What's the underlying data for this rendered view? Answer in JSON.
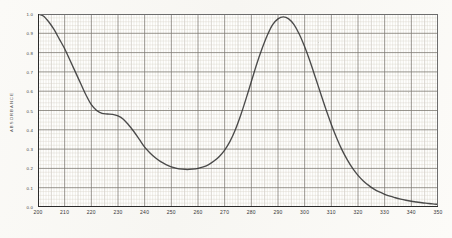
{
  "chart_data": {
    "type": "line",
    "title": "",
    "xlabel": "",
    "ylabel": "ABSORBANCE",
    "xlim": [
      200,
      350
    ],
    "ylim": [
      0.0,
      1.0
    ],
    "grid": true,
    "grid_style": "graph-paper, minor every 1 nm / 0.02 A, major every 10 nm / 0.1 A",
    "legend": "none",
    "xticks": [
      200,
      210,
      220,
      230,
      240,
      250,
      260,
      270,
      280,
      290,
      300,
      310,
      320,
      330,
      340,
      350
    ],
    "xticklabels": [
      "200",
      "210",
      "220",
      "230",
      "240",
      "250",
      "260",
      "270",
      "280",
      "290",
      "300",
      "310",
      "320",
      "330",
      "340",
      "350"
    ],
    "yticks": [
      0.0,
      0.1,
      0.2,
      0.3,
      0.4,
      0.5,
      0.6,
      0.7,
      0.8,
      0.9,
      1.0
    ],
    "yticklabels": [
      "0.0",
      "0.1",
      "0.2",
      "0.3",
      "0.4",
      "0.5",
      "0.6",
      "0.7",
      "0.8",
      "0.9",
      "1.0"
    ],
    "series": [
      {
        "name": "absorbance-trace",
        "color": "#333333",
        "x": [
          200,
          202,
          204,
          206,
          208,
          210,
          212,
          214,
          216,
          218,
          220,
          222,
          224,
          226,
          228,
          230,
          232,
          234,
          236,
          238,
          240,
          242,
          244,
          246,
          248,
          250,
          252,
          254,
          256,
          258,
          260,
          262,
          264,
          266,
          268,
          270,
          272,
          274,
          276,
          278,
          280,
          282,
          284,
          286,
          288,
          290,
          292,
          294,
          296,
          298,
          300,
          302,
          304,
          306,
          308,
          310,
          312,
          314,
          316,
          318,
          320,
          322,
          324,
          326,
          328,
          330,
          332,
          334,
          336,
          338,
          340,
          342,
          344,
          346,
          348,
          350
        ],
        "y": [
          1.0,
          0.99,
          0.96,
          0.92,
          0.87,
          0.82,
          0.76,
          0.7,
          0.64,
          0.58,
          0.53,
          0.5,
          0.485,
          0.482,
          0.48,
          0.472,
          0.455,
          0.425,
          0.39,
          0.35,
          0.31,
          0.28,
          0.255,
          0.235,
          0.22,
          0.208,
          0.2,
          0.196,
          0.194,
          0.196,
          0.2,
          0.208,
          0.22,
          0.238,
          0.262,
          0.295,
          0.34,
          0.4,
          0.475,
          0.56,
          0.65,
          0.74,
          0.82,
          0.89,
          0.945,
          0.975,
          0.985,
          0.975,
          0.945,
          0.895,
          0.83,
          0.755,
          0.672,
          0.588,
          0.505,
          0.428,
          0.358,
          0.296,
          0.244,
          0.2,
          0.164,
          0.135,
          0.112,
          0.093,
          0.078,
          0.066,
          0.056,
          0.048,
          0.041,
          0.035,
          0.03,
          0.026,
          0.022,
          0.019,
          0.016,
          0.014
        ]
      }
    ],
    "annotations": {
      "peak": {
        "x": 290,
        "y": 0.985,
        "note": "absorption maximum"
      },
      "shoulder": {
        "x": 226,
        "y": 0.482,
        "note": "shoulder"
      },
      "minimum": {
        "x": 256,
        "y": 0.194,
        "note": "trough"
      }
    }
  }
}
